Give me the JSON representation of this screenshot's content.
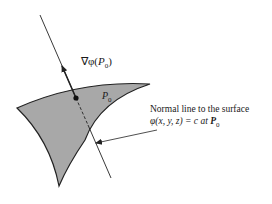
{
  "diagram": {
    "gradient_label": {
      "prefix": "∇φ(",
      "var": "P",
      "sub": "0",
      "suffix": ")"
    },
    "point_label": {
      "var": "P",
      "sub": "0"
    },
    "annotation": {
      "line1": "Normal line to the surface",
      "line2_prefix": "φ(x, y, z) = c at ",
      "line2_var": "P",
      "line2_sub": "0"
    },
    "colors": {
      "surface_fill": "#a8a8a8",
      "stroke": "#222222",
      "background": "#ffffff"
    }
  }
}
